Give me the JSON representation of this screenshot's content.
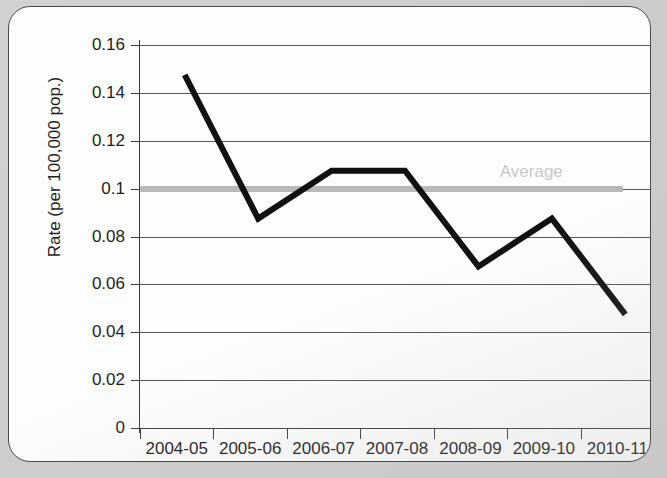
{
  "chart_data": {
    "type": "line",
    "title": "",
    "xlabel": "",
    "ylabel": "Rate (per 100,000 pop.)",
    "categories": [
      "2004-05",
      "2005-06",
      "2006-07",
      "2007-08",
      "2008-09",
      "2009-10",
      "2010-11"
    ],
    "series": [
      {
        "name": "Rate",
        "values": [
          0.15,
          0.09,
          0.11,
          0.11,
          0.07,
          0.09,
          0.05
        ],
        "color": "#111111",
        "line_width_px": 6
      }
    ],
    "reference_lines": [
      {
        "name": "Average",
        "label": "Average",
        "value": 0.1,
        "color": "#b9b9b9",
        "label_color": "#c9c9c9",
        "style": "thick-flat"
      }
    ],
    "ylim": [
      0,
      0.16
    ],
    "yticks": [
      0,
      0.02,
      0.04,
      0.06,
      0.08,
      0.1,
      0.12,
      0.14,
      0.16
    ],
    "ytick_labels": [
      "0",
      "0.02",
      "0.04",
      "0.06",
      "0.08",
      "0.1",
      "0.12",
      "0.14",
      "0.16"
    ],
    "grid": true,
    "grid_axis": "y",
    "legend": false,
    "legend_position": "none",
    "annotations": [
      {
        "text": "Average",
        "x_category_fraction": 0.72,
        "y": 0.105
      }
    ]
  },
  "axes": {
    "y_title": "Rate (per 100,000 pop.)",
    "y_tick_labels": [
      "0.16",
      "0.14",
      "0.12",
      "0.1",
      "0.08",
      "0.06",
      "0.04",
      "0.02",
      "0"
    ],
    "x_tick_labels": [
      "2004-05",
      "2005-06",
      "2006-07",
      "2007-08",
      "2008-09",
      "2009-10",
      "2010-11"
    ]
  },
  "colors": {
    "series_line": "#111111",
    "average_line": "#b9b9b9",
    "average_label": "#c9c9c9",
    "gridline": "#555555",
    "axis": "#3d3d3d",
    "card_background": "#fdfdfd",
    "page_background": "#cfcfcf"
  }
}
